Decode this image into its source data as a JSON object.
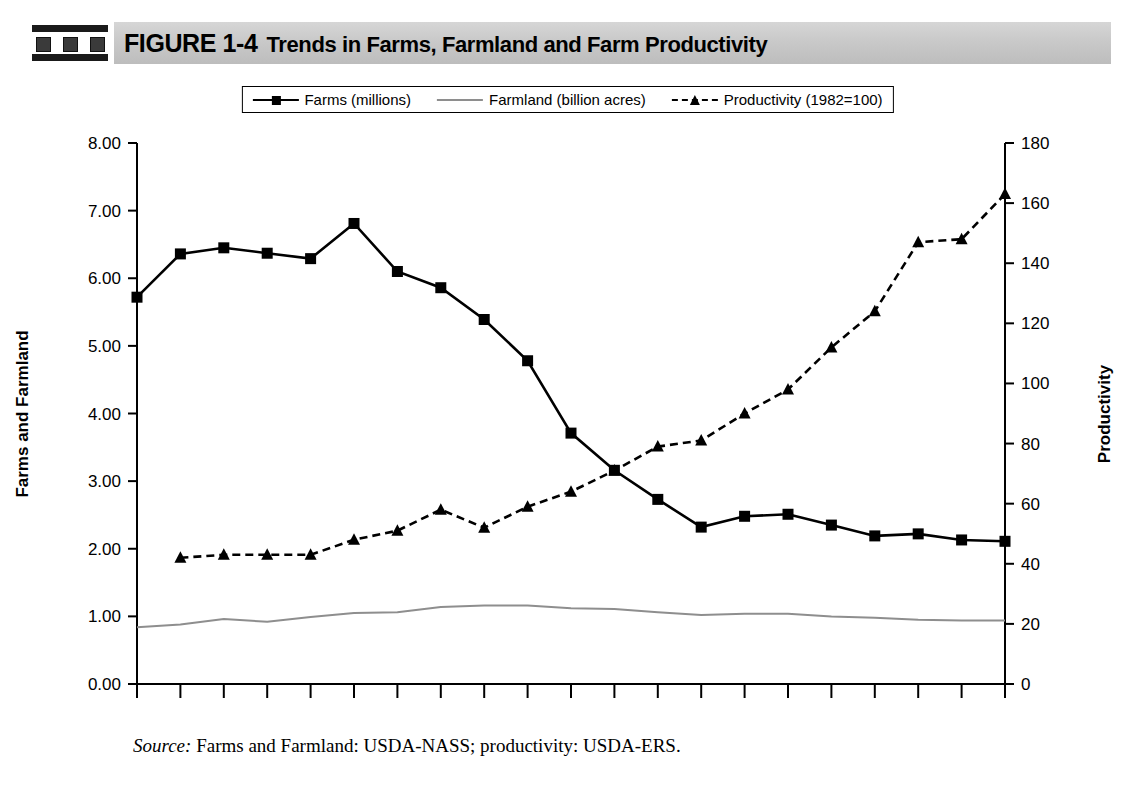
{
  "header": {
    "icon": "film-strip-icon",
    "figure_number": "FIGURE 1-4",
    "title": "Trends in Farms, Farmland and Farm Productivity"
  },
  "legend": {
    "position": "top-center",
    "entries": [
      {
        "label": "Farms (millions)",
        "marker": "square",
        "style": "solid",
        "color": "#000000"
      },
      {
        "label": "Farmland (billion acres)",
        "marker": "none",
        "style": "solid",
        "color": "#8e8e8e"
      },
      {
        "label": "Productivity (1982=100)",
        "marker": "triangle",
        "style": "dashed",
        "color": "#000000"
      }
    ]
  },
  "source": {
    "keyword": "Source:",
    "text": "Farms and Farmland: USDA-NASS; productivity: USDA-ERS."
  },
  "chart_data": {
    "type": "line",
    "title": "Trends in Farms, Farmland and Farm Productivity",
    "xlabel": "",
    "ylabel": "Farms and Farmland",
    "y2label": "Productivity",
    "ylim": [
      0,
      8
    ],
    "y2lim": [
      0,
      180
    ],
    "yticks": [
      "0.00",
      "1.00",
      "2.00",
      "3.00",
      "4.00",
      "5.00",
      "6.00",
      "7.00",
      "8.00"
    ],
    "y2ticks": [
      "0",
      "20",
      "40",
      "60",
      "80",
      "100",
      "120",
      "140",
      "160",
      "180"
    ],
    "grid": false,
    "legend_position": "top-center",
    "categories": [
      "1900",
      "10",
      "20",
      "25",
      "30",
      "35",
      "40",
      "45",
      "50",
      "54",
      "59",
      "64",
      "69",
      "74",
      "78",
      "82",
      "87",
      "92",
      "97",
      "2002",
      "2004"
    ],
    "series": [
      {
        "name": "Farms (millions)",
        "axis": "left",
        "marker": "square",
        "style": "solid",
        "color": "#000000",
        "values": [
          5.72,
          6.36,
          6.45,
          6.37,
          6.29,
          6.81,
          6.1,
          5.86,
          5.39,
          4.78,
          3.71,
          3.16,
          2.73,
          2.32,
          2.48,
          2.51,
          2.35,
          2.19,
          2.22,
          2.13,
          2.11
        ]
      },
      {
        "name": "Farmland (billion acres)",
        "axis": "left",
        "marker": "none",
        "style": "solid",
        "color": "#8e8e8e",
        "values": [
          0.84,
          0.88,
          0.96,
          0.92,
          0.99,
          1.05,
          1.06,
          1.14,
          1.16,
          1.16,
          1.12,
          1.11,
          1.06,
          1.02,
          1.04,
          1.04,
          1.0,
          0.98,
          0.95,
          0.94,
          0.94
        ]
      },
      {
        "name": "Productivity (1982=100)",
        "axis": "right",
        "marker": "triangle",
        "style": "dashed",
        "color": "#000000",
        "values": [
          null,
          42,
          43,
          43,
          43,
          48,
          51,
          58,
          52,
          59,
          64,
          71,
          79,
          81,
          90,
          98,
          112,
          124,
          147,
          148,
          163
        ]
      }
    ]
  }
}
